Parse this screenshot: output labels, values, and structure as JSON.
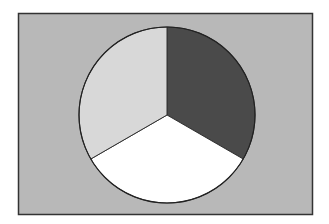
{
  "chart_data": {
    "type": "pie",
    "title": "",
    "labels": [
      "Slice A",
      "Slice B",
      "Slice C"
    ],
    "values": [
      33.3,
      33.3,
      33.3
    ],
    "colors": [
      "#4a4a4a",
      "#ffffff",
      "#d8d8d8"
    ],
    "start_angle_deg": 0,
    "direction": "clockwise",
    "legend": "none",
    "background": "#b8b8b8",
    "frame_border": "#333333"
  }
}
